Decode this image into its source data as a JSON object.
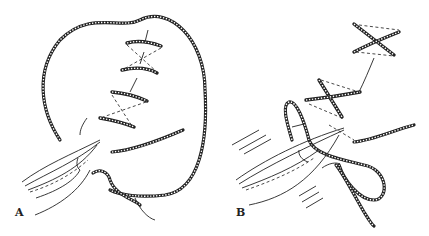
{
  "figure": {
    "panels": [
      {
        "id": "A",
        "label": "A",
        "description": "Suture loop with figure-of-eight cross stitches being tied with forceps"
      },
      {
        "id": "B",
        "label": "B",
        "description": "Cross (X) stitches completed; forceps pulling suture loop to tie knot"
      }
    ]
  }
}
